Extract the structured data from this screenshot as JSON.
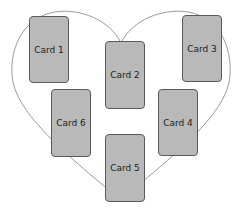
{
  "diagram": {
    "type": "heart-spread",
    "outline_color": "#9a9a9a",
    "card_fill": "#b9b9b9",
    "card_border": "#5a5a5a",
    "cards": [
      {
        "label": "Card 1",
        "x": 29,
        "y": 16,
        "w": 40,
        "h": 67
      },
      {
        "label": "Card 2",
        "x": 105,
        "y": 41,
        "w": 40,
        "h": 68
      },
      {
        "label": "Card 3",
        "x": 182,
        "y": 15,
        "w": 40,
        "h": 67
      },
      {
        "label": "Card 4",
        "x": 158,
        "y": 89,
        "w": 40,
        "h": 67
      },
      {
        "label": "Card 5",
        "x": 105,
        "y": 134,
        "w": 40,
        "h": 68
      },
      {
        "label": "Card 6",
        "x": 51,
        "y": 89,
        "w": 40,
        "h": 68
      }
    ]
  }
}
